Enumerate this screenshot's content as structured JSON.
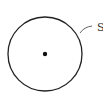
{
  "diagram": {
    "circle": {
      "cx": 45,
      "cy": 54,
      "r": 37,
      "stroke": "#222222"
    },
    "center_point": {
      "cx": 45,
      "cy": 54,
      "r": 2.2
    },
    "label": {
      "text": "S"
    }
  }
}
